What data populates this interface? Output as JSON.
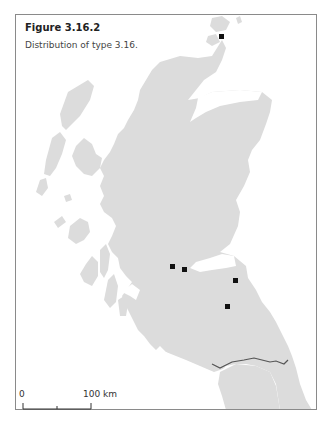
{
  "figure": {
    "title": "Figure 3.16.2",
    "caption": "Distribution of type 3.16."
  },
  "map": {
    "region": "Scotland",
    "land_color": "#dcdcdc",
    "border_color": "#555555",
    "marker_color": "#111111",
    "markers": [
      {
        "id": "site-1",
        "x": 222,
        "y": 37
      },
      {
        "id": "site-2",
        "x": 173,
        "y": 267
      },
      {
        "id": "site-3",
        "x": 185,
        "y": 270
      },
      {
        "id": "site-4",
        "x": 236,
        "y": 281
      },
      {
        "id": "site-5",
        "x": 228,
        "y": 307
      }
    ]
  },
  "scale_bar": {
    "start_label": "0",
    "end_label": "100 km"
  }
}
